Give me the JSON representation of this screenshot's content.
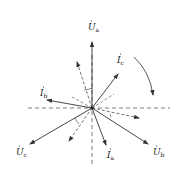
{
  "diagram": {
    "type": "phasor-diagram",
    "center": [
      92,
      108
    ],
    "colors": {
      "line": "#333333",
      "background": "#ffffff"
    },
    "phasors": [
      {
        "id": "Ua",
        "symbol": "U",
        "subscript": "a",
        "tip": [
          92,
          42
        ],
        "label_pos": [
          88,
          30
        ]
      },
      {
        "id": "Ub",
        "symbol": "U",
        "subscript": "b",
        "tip": [
          148,
          144
        ],
        "label_pos": [
          153,
          155
        ]
      },
      {
        "id": "Uc",
        "symbol": "U",
        "subscript": "c",
        "tip": [
          30,
          144
        ],
        "label_pos": [
          16,
          155
        ]
      },
      {
        "id": "Ia",
        "symbol": "I",
        "subscript": "a",
        "tip": [
          106,
          145
        ],
        "label_pos": [
          107,
          158
        ]
      },
      {
        "id": "Ib",
        "symbol": "I",
        "subscript": "b",
        "tip": [
          47,
          100
        ],
        "label_pos": [
          40,
          96
        ]
      },
      {
        "id": "Ic",
        "symbol": "I",
        "subscript": "c",
        "tip": [
          118,
          74
        ],
        "label_pos": [
          117,
          63
        ]
      }
    ],
    "dashed_axes": {
      "horizontal": [
        28,
        170
      ],
      "vertical": [
        55,
        166
      ]
    },
    "dashed_phasors": [
      {
        "tip": [
          77,
          62
        ]
      },
      {
        "tip": [
          139,
          118
        ]
      },
      {
        "tip": [
          69,
          141
        ]
      }
    ],
    "rotation_arrow": {
      "direction": "clockwise"
    }
  }
}
